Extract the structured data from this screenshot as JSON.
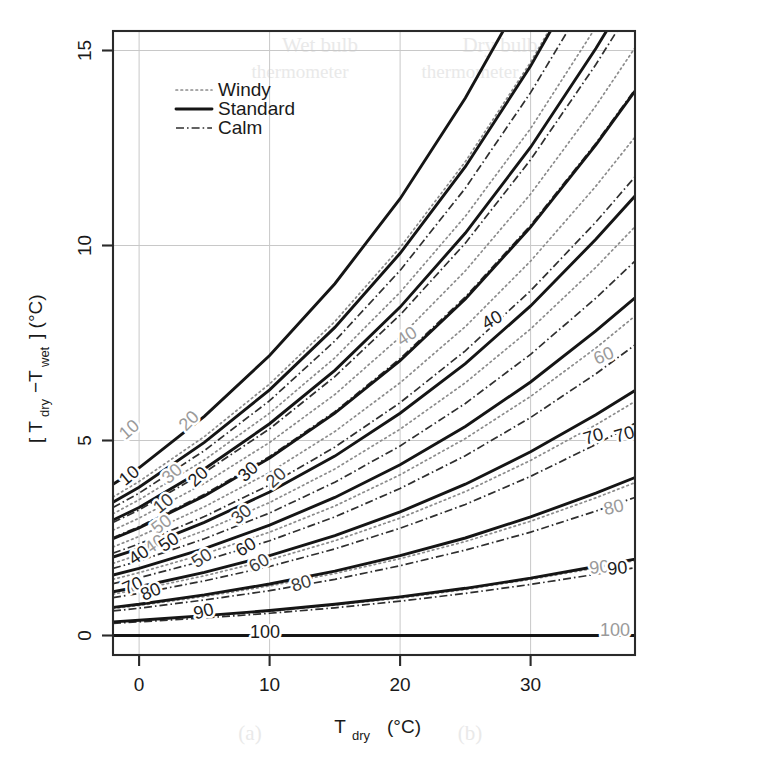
{
  "figure": {
    "background": "#ffffff",
    "plot_area_px": {
      "left": 113,
      "top": 31,
      "right": 635,
      "bottom": 655
    }
  },
  "axes": {
    "x": {
      "title_main": "T",
      "title_sub": "dry",
      "title_unit": "(°C)",
      "ticks": [
        0,
        10,
        20,
        30
      ],
      "tick_labels": [
        "0",
        "10",
        "20",
        "30"
      ],
      "range": [
        -2,
        38
      ]
    },
    "y": {
      "title_open": "[ T",
      "title_sub1": "dry",
      "title_minus": "−T",
      "title_sub2": "wet",
      "title_close": "] (°C)",
      "ticks": [
        0,
        5,
        10,
        15
      ],
      "tick_labels": [
        "0",
        "5",
        "10",
        "15"
      ],
      "range": [
        -0.5,
        15.5
      ]
    }
  },
  "legend": {
    "position": "top-left-inside",
    "entries": [
      {
        "label": "Windy",
        "style": "dotted",
        "color": "#8c8c8c"
      },
      {
        "label": "Standard",
        "style": "solid",
        "color": "#151515"
      },
      {
        "label": "Calm",
        "style": "dash-dot",
        "color": "#2f2f2f"
      }
    ]
  },
  "chart_data": {
    "type": "line",
    "title": "",
    "subtitle": "",
    "xlabel": "T_dry (°C)",
    "ylabel": "[ T_dry - T_wet ] (°C)",
    "xlim": [
      -2,
      38
    ],
    "ylim": [
      -0.5,
      15.5
    ],
    "grid": true,
    "legend_position": "top-left inside",
    "contour_variable": "Relative humidity",
    "contour_unit": "%",
    "contour_levels": [
      10,
      20,
      30,
      40,
      50,
      60,
      70,
      80,
      90,
      100
    ],
    "x_samples": [
      -2,
      0,
      5,
      10,
      15,
      20,
      25,
      30,
      35,
      38
    ],
    "series": [
      {
        "name": "Windy",
        "style": "dotted",
        "color": "#8c8c8c",
        "contours": [
          {
            "level": 10,
            "y": [
              3.55,
              3.95,
              5.1,
              6.45,
              8.05,
              9.95,
              12.15,
              14.7,
              17.6,
              19.5
            ]
          },
          {
            "level": 20,
            "y": [
              3.12,
              3.48,
              4.5,
              5.7,
              7.12,
              8.8,
              10.75,
              13.0,
              15.6,
              17.3
            ]
          },
          {
            "level": 30,
            "y": [
              2.7,
              3.01,
              3.9,
              4.95,
              6.18,
              7.65,
              9.35,
              11.32,
              13.58,
              15.07
            ]
          },
          {
            "level": 40,
            "y": [
              2.27,
              2.54,
              3.3,
              4.18,
              5.23,
              6.48,
              7.92,
              9.6,
              11.52,
              12.78
            ]
          },
          {
            "level": 50,
            "y": [
              1.85,
              2.07,
              2.69,
              3.41,
              4.27,
              5.29,
              6.48,
              7.86,
              9.44,
              10.48
            ]
          },
          {
            "level": 60,
            "y": [
              1.44,
              1.61,
              2.09,
              2.65,
              3.32,
              4.12,
              5.05,
              6.13,
              7.37,
              8.19
            ]
          },
          {
            "level": 70,
            "y": [
              1.06,
              1.18,
              1.53,
              1.94,
              2.43,
              3.01,
              3.69,
              4.49,
              5.4,
              6.0
            ]
          },
          {
            "level": 80,
            "y": [
              0.69,
              0.77,
              1.0,
              1.27,
              1.59,
              1.97,
              2.41,
              2.93,
              3.53,
              3.92
            ]
          },
          {
            "level": 90,
            "y": [
              0.34,
              0.38,
              0.49,
              0.62,
              0.78,
              0.96,
              1.18,
              1.44,
              1.73,
              1.92
            ]
          },
          {
            "level": 100,
            "y": [
              0.0,
              0.0,
              0.0,
              0.0,
              0.0,
              0.0,
              0.0,
              0.0,
              0.0,
              0.0
            ]
          }
        ]
      },
      {
        "name": "Standard",
        "style": "solid",
        "color": "#151515",
        "contours": [
          {
            "level": 10,
            "y": [
              3.88,
              4.3,
              5.62,
              7.18,
              9.02,
              11.2,
              13.78,
              16.75,
              20.1,
              22.3
            ]
          },
          {
            "level": 20,
            "y": [
              3.42,
              3.8,
              4.95,
              6.3,
              7.9,
              9.8,
              12.02,
              14.6,
              17.55,
              19.48
            ]
          },
          {
            "level": 30,
            "y": [
              2.96,
              3.28,
              4.27,
              5.43,
              6.8,
              8.42,
              10.32,
              12.52,
              15.05,
              16.7
            ]
          },
          {
            "level": 40,
            "y": [
              2.48,
              2.76,
              3.58,
              4.55,
              5.7,
              7.05,
              8.63,
              10.47,
              12.58,
              13.96
            ]
          },
          {
            "level": 50,
            "y": [
              2.01,
              2.23,
              2.9,
              3.68,
              4.6,
              5.7,
              6.97,
              8.45,
              10.16,
              11.27
            ]
          },
          {
            "level": 60,
            "y": [
              1.55,
              1.72,
              2.23,
              2.83,
              3.54,
              4.38,
              5.36,
              6.5,
              7.81,
              8.66
            ]
          },
          {
            "level": 70,
            "y": [
              1.12,
              1.25,
              1.62,
              2.05,
              2.56,
              3.17,
              3.88,
              4.71,
              5.66,
              6.28
            ]
          },
          {
            "level": 80,
            "y": [
              0.72,
              0.8,
              1.04,
              1.32,
              1.65,
              2.05,
              2.5,
              3.04,
              3.65,
              4.05
            ]
          },
          {
            "level": 90,
            "y": [
              0.35,
              0.39,
              0.51,
              0.64,
              0.8,
              0.99,
              1.21,
              1.47,
              1.77,
              1.96
            ]
          },
          {
            "level": 100,
            "y": [
              0.0,
              0.0,
              0.0,
              0.0,
              0.0,
              0.0,
              0.0,
              0.0,
              0.0,
              0.0
            ]
          }
        ]
      },
      {
        "name": "Calm",
        "style": "dash-dot",
        "color": "#2f2f2f",
        "contours": [
          {
            "level": 10,
            "y": [
              3.28,
              3.65,
              4.74,
              6.02,
              7.55,
              9.36,
              11.47,
              13.92,
              16.7,
              18.52
            ]
          },
          {
            "level": 20,
            "y": [
              2.9,
              3.22,
              4.18,
              5.3,
              6.64,
              8.22,
              10.06,
              12.2,
              14.64,
              16.24
            ]
          },
          {
            "level": 30,
            "y": [
              2.51,
              2.79,
              3.62,
              4.59,
              5.74,
              7.1,
              8.68,
              10.52,
              12.62,
              14.0
            ]
          },
          {
            "level": 40,
            "y": [
              2.11,
              2.35,
              3.05,
              3.86,
              4.83,
              5.97,
              7.3,
              8.84,
              10.6,
              11.76
            ]
          },
          {
            "level": 50,
            "y": [
              1.72,
              1.91,
              2.48,
              3.14,
              3.93,
              4.86,
              5.95,
              7.21,
              8.65,
              9.6
            ]
          },
          {
            "level": 60,
            "y": [
              1.33,
              1.48,
              1.92,
              2.43,
              3.04,
              3.77,
              4.61,
              5.59,
              6.71,
              7.45
            ]
          },
          {
            "level": 70,
            "y": [
              0.97,
              1.08,
              1.4,
              1.77,
              2.22,
              2.75,
              3.36,
              4.08,
              4.9,
              5.44
            ]
          },
          {
            "level": 80,
            "y": [
              0.63,
              0.7,
              0.91,
              1.15,
              1.44,
              1.79,
              2.19,
              2.65,
              3.19,
              3.54
            ]
          },
          {
            "level": 90,
            "y": [
              0.31,
              0.35,
              0.45,
              0.57,
              0.71,
              0.88,
              1.08,
              1.31,
              1.57,
              1.74
            ]
          },
          {
            "level": 100,
            "y": [
              0.0,
              0.0,
              0.0,
              0.0,
              0.0,
              0.0,
              0.0,
              0.0,
              0.0,
              0.0
            ]
          }
        ]
      }
    ],
    "inline_contour_labels": [
      {
        "text": "10",
        "x_px": 133,
        "y_px": 434,
        "rot": -41,
        "series": "Windy"
      },
      {
        "text": "20",
        "x_px": 193,
        "y_px": 425,
        "rot": -45,
        "series": "Windy"
      },
      {
        "text": "10",
        "x_px": 133,
        "y_px": 480,
        "rot": -40,
        "series": "Standard"
      },
      {
        "text": "30",
        "x_px": 176,
        "y_px": 478,
        "rot": -42,
        "series": "Windy"
      },
      {
        "text": "20",
        "x_px": 202,
        "y_px": 481,
        "rot": -43,
        "series": "Standard"
      },
      {
        "text": "30",
        "x_px": 252,
        "y_px": 476,
        "rot": -43,
        "series": "Standard"
      },
      {
        "text": "20",
        "x_px": 280,
        "y_px": 482,
        "rot": -42,
        "series": "Calm"
      },
      {
        "text": "10",
        "x_px": 167,
        "y_px": 508,
        "rot": -39,
        "series": "Calm"
      },
      {
        "text": "30",
        "x_px": 245,
        "y_px": 519,
        "rot": -39,
        "series": "Calm"
      },
      {
        "text": "50",
        "x_px": 165,
        "y_px": 529,
        "rot": -37,
        "series": "Windy"
      },
      {
        "text": "40",
        "x_px": 158,
        "y_px": 549,
        "rot": -35,
        "series": "Windy"
      },
      {
        "text": "50",
        "x_px": 172,
        "y_px": 547,
        "rot": -34,
        "series": "Standard"
      },
      {
        "text": "40",
        "x_px": 142,
        "y_px": 560,
        "rot": -34,
        "series": "Standard"
      },
      {
        "text": "50",
        "x_px": 205,
        "y_px": 563,
        "rot": -33,
        "series": "Calm"
      },
      {
        "text": "60",
        "x_px": 249,
        "y_px": 552,
        "rot": -32,
        "series": "Standard"
      },
      {
        "text": "60",
        "x_px": 262,
        "y_px": 568,
        "rot": -30,
        "series": "Calm"
      },
      {
        "text": "70",
        "x_px": 135,
        "y_px": 591,
        "rot": -24,
        "series": "Standard"
      },
      {
        "text": "80",
        "x_px": 153,
        "y_px": 597,
        "rot": -23,
        "series": "Standard"
      },
      {
        "text": "80",
        "x_px": 303,
        "y_px": 589,
        "rot": -18,
        "series": "Calm"
      },
      {
        "text": "90",
        "x_px": 205,
        "y_px": 617,
        "rot": -14,
        "series": "Standard"
      },
      {
        "text": "100",
        "x_px": 265,
        "y_px": 638,
        "rot": 0,
        "series": "Standard"
      },
      {
        "text": "40",
        "x_px": 410,
        "y_px": 341,
        "rot": -33,
        "series": "Windy"
      },
      {
        "text": "40",
        "x_px": 495,
        "y_px": 325,
        "rot": -30,
        "series": "Standard"
      },
      {
        "text": "60",
        "x_px": 606,
        "y_px": 361,
        "rot": -23,
        "series": "Windy"
      },
      {
        "text": "70",
        "x_px": 595,
        "y_px": 442,
        "rot": -17,
        "series": "Standard"
      },
      {
        "text": "70",
        "x_px": 626,
        "y_px": 440,
        "rot": -16,
        "series": "Standard"
      },
      {
        "text": "80",
        "x_px": 615,
        "y_px": 513,
        "rot": -13,
        "series": "Windy"
      },
      {
        "text": "90",
        "x_px": 600,
        "y_px": 573,
        "rot": -6,
        "series": "Windy"
      },
      {
        "text": "90",
        "x_px": 618,
        "y_px": 574,
        "rot": -6,
        "series": "Standard"
      },
      {
        "text": "100",
        "x_px": 615,
        "y_px": 636,
        "rot": 0,
        "series": "Windy"
      }
    ]
  }
}
